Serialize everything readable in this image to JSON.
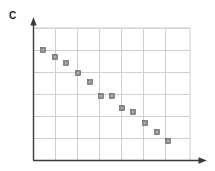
{
  "figure": {
    "panel_label": "C",
    "background_color": "#ffffff"
  },
  "chart_data": {
    "type": "scatter",
    "title": "C",
    "xlabel": "",
    "ylabel": "",
    "xlim": [
      0,
      7
    ],
    "ylim": [
      0,
      6
    ],
    "grid": true,
    "grid_color": "#cfcfcf",
    "axis_color": "#3a3a3a",
    "legend": null,
    "xticklabels": [],
    "yticklabels": [],
    "marker": {
      "shape": "square",
      "size_px": 5,
      "fill_color": "#8a8a8a",
      "edge_color": "#5e5e5e",
      "center_color": "#d8d8d8"
    },
    "series": [
      {
        "name": "series-1",
        "x": [
          0.45,
          1.0,
          1.55,
          2.05,
          2.6,
          3.1,
          3.6,
          4.05,
          4.55,
          5.1,
          5.65,
          6.15
        ],
        "y": [
          5.0,
          4.7,
          4.25,
          3.9,
          3.5,
          2.9,
          2.9,
          2.35,
          2.2,
          1.7,
          1.25,
          0.85
        ]
      }
    ],
    "annotations": []
  },
  "axes": {
    "x_axis_arrow": true,
    "y_axis_arrow": true,
    "plot_left_px": 33,
    "plot_right_px": 190,
    "plot_top_px": 28,
    "plot_bottom_px": 160,
    "vertical_gridlines_px": [
      55,
      77,
      99,
      121,
      143,
      165
    ],
    "horizontal_gridlines_px": [
      28,
      50,
      72,
      94,
      116,
      138
    ]
  },
  "points_px": [
    {
      "cx": 43,
      "cy": 50
    },
    {
      "cx": 55,
      "cy": 57
    },
    {
      "cx": 66,
      "cy": 63
    },
    {
      "cx": 78,
      "cy": 73
    },
    {
      "cx": 90,
      "cy": 82
    },
    {
      "cx": 101,
      "cy": 96
    },
    {
      "cx": 112,
      "cy": 96
    },
    {
      "cx": 122,
      "cy": 108
    },
    {
      "cx": 133,
      "cy": 112
    },
    {
      "cx": 145,
      "cy": 123
    },
    {
      "cx": 157,
      "cy": 132
    },
    {
      "cx": 168,
      "cy": 141
    }
  ]
}
